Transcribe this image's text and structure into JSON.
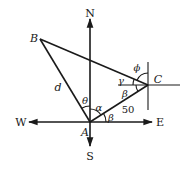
{
  "diagram": {
    "type": "compass-bearing-triangle",
    "compass": {
      "north": "N",
      "south": "S",
      "east": "E",
      "west": "W"
    },
    "points": {
      "A": "A",
      "B": "B",
      "C": "C"
    },
    "segments": {
      "AB": "d",
      "AC": "50"
    },
    "angles": {
      "theta": "θ",
      "alpha": "α",
      "beta_at_A": "β",
      "beta_at_C": "β",
      "gamma": "γ",
      "phi": "ϕ"
    },
    "colors": {
      "stroke": "#1a1a1a",
      "background": "#ffffff"
    }
  }
}
